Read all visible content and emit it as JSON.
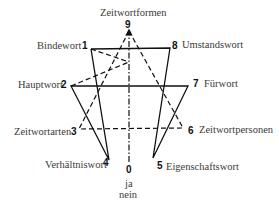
{
  "diagram": {
    "nodes": [
      {
        "id": "9",
        "label": "Zeitwortformen"
      },
      {
        "id": "1",
        "label": "Bindewort"
      },
      {
        "id": "8",
        "label": "Umstandswort"
      },
      {
        "id": "2",
        "label": "Hauptwort"
      },
      {
        "id": "7",
        "label": "Fürwort"
      },
      {
        "id": "3",
        "label": "Zeitwortarten"
      },
      {
        "id": "6",
        "label": "Zeitwortpersonen"
      },
      {
        "id": "4",
        "label": "Verhältniswort"
      },
      {
        "id": "5",
        "label": "Eigenschaftswort"
      },
      {
        "id": "0",
        "label_lines": [
          "ja",
          "nein"
        ]
      }
    ],
    "solid_path": [
      "1",
      "4",
      "2",
      "7",
      "5",
      "8",
      "1"
    ],
    "dashed_path": [
      "9",
      "3",
      "6",
      "9"
    ],
    "dashed_lines": [
      [
        "2",
        "8"
      ],
      [
        "1",
        "7"
      ]
    ],
    "axis": {
      "from": "0",
      "to": "9",
      "style": "dash-dot",
      "arrow": "up"
    }
  }
}
